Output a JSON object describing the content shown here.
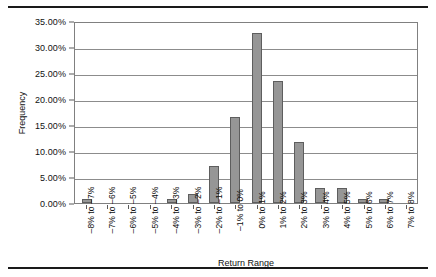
{
  "chart_data": {
    "type": "bar",
    "title": "",
    "xlabel": "Return Range",
    "ylabel": "Frequency",
    "ylim": [
      0,
      35
    ],
    "grid": true,
    "legend": false,
    "y_tick_labels": [
      "35.00%",
      "30.00%",
      "25.00%",
      "20.00%",
      "15.00%",
      "10.00%",
      "5.00%",
      "0.00%"
    ],
    "y_tick_values": [
      35,
      30,
      25,
      20,
      15,
      10,
      5,
      0
    ],
    "categories": [
      "–8% to –7%",
      "–7% to –6%",
      "–6% to –5%",
      "–5% to –4%",
      "–4% to –3%",
      "–3% to –2%",
      "–2% to –1%",
      "–1% to 0%",
      "0% to 1%",
      "1% to 2%",
      "2% to 3%",
      "3% to 4%",
      "4% to 5%",
      "5% to 6%",
      "6% to 7%",
      "7% to 8%"
    ],
    "values": [
      0.7,
      0.0,
      0.0,
      0.0,
      0.7,
      1.8,
      7.1,
      16.6,
      32.6,
      23.5,
      11.8,
      2.9,
      2.9,
      0.7,
      0.7,
      0.0
    ],
    "series_name": "Frequency",
    "bar_color": "#969696",
    "bar_border_color": "#5e5e5e",
    "gridline_color": "#8c8c8c",
    "axis_color": "#808080"
  }
}
